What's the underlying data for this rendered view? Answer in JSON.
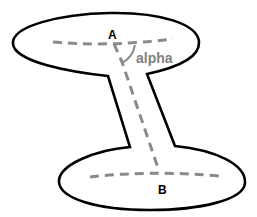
{
  "diagram": {
    "labels": {
      "point_a": "A",
      "point_b": "B",
      "angle": "alpha"
    },
    "colors": {
      "outline": "#000000",
      "dashed": "#8a8a8a",
      "angle_text": "#808080"
    }
  }
}
